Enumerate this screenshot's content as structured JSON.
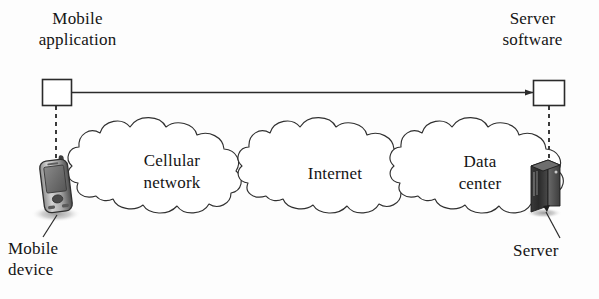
{
  "diagram": {
    "background_color": "#fdfdfd",
    "line_color": "#2b2b2b",
    "text_color": "#141414",
    "labels": {
      "mobile_application": "Mobile\napplication",
      "server_software": "Server\nsoftware",
      "mobile_device": "Mobile\ndevice",
      "server": "Server"
    },
    "clouds": [
      {
        "name": "cellular-network",
        "label": "Cellular\nnetwork"
      },
      {
        "name": "internet",
        "label": "Internet"
      },
      {
        "name": "data-center",
        "label": "Data\ncenter"
      }
    ],
    "nodes": [
      {
        "name": "mobile-application-box",
        "shape": "rectangle",
        "label": ""
      },
      {
        "name": "server-software-box",
        "shape": "rectangle",
        "label": ""
      },
      {
        "name": "mobile-device-phone",
        "shape": "smartphone-icon",
        "label": ""
      },
      {
        "name": "server-tower",
        "shape": "server-tower-icon",
        "label": ""
      }
    ],
    "connectors": [
      {
        "name": "application-to-server-link",
        "style": "solid",
        "arrows": "both"
      },
      {
        "name": "application-to-device-link",
        "style": "dashed",
        "arrows": "none"
      },
      {
        "name": "server-software-to-server-link",
        "style": "dashed",
        "arrows": "none"
      },
      {
        "name": "mobile-device-leader",
        "style": "solid",
        "arrows": "none"
      },
      {
        "name": "server-leader",
        "style": "solid",
        "arrows": "none"
      }
    ]
  }
}
